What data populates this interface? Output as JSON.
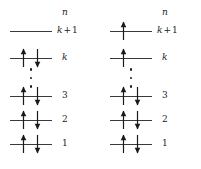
{
  "figure": {
    "background_color": "#ffffff",
    "line_color": "#3a3a3a",
    "arrow_color": "#1a1a1a",
    "text_color": "#1a1a1a"
  },
  "diagrams": [
    {
      "id": "left",
      "name": "ground-state-configuration",
      "header": "n",
      "levels": [
        {
          "id": "k-plus-1",
          "label_parts": {
            "base": "k",
            "op": "+",
            "num": "1"
          },
          "label_text": "k + 1",
          "y": 31,
          "line_x": 10,
          "line_width": 42,
          "label_x": 57,
          "spins": []
        },
        {
          "id": "k",
          "label_parts": {
            "base": "k",
            "op": "",
            "num": ""
          },
          "label_text": "k",
          "y": 58,
          "line_x": 10,
          "line_width": 42,
          "label_x": 62,
          "spins": [
            {
              "direction": "up",
              "x": 20
            },
            {
              "direction": "down",
              "x": 34
            }
          ]
        },
        {
          "id": "3",
          "label_parts": {
            "base": "",
            "op": "",
            "num": "3"
          },
          "label_text": "3",
          "y": 96,
          "line_x": 10,
          "line_width": 42,
          "label_x": 62,
          "spins": [
            {
              "direction": "up",
              "x": 20
            },
            {
              "direction": "down",
              "x": 34
            }
          ]
        },
        {
          "id": "2",
          "label_parts": {
            "base": "",
            "op": "",
            "num": "2"
          },
          "label_text": "2",
          "y": 120,
          "line_x": 10,
          "line_width": 42,
          "label_x": 62,
          "spins": [
            {
              "direction": "up",
              "x": 20
            },
            {
              "direction": "down",
              "x": 34
            }
          ]
        },
        {
          "id": "1",
          "label_parts": {
            "base": "",
            "op": "",
            "num": "1"
          },
          "label_text": "1",
          "y": 144,
          "line_x": 10,
          "line_width": 42,
          "label_x": 62,
          "spins": [
            {
              "direction": "up",
              "x": 20
            },
            {
              "direction": "down",
              "x": 34
            }
          ]
        }
      ],
      "ellipsis": {
        "x": 26,
        "y": 68,
        "height": 20,
        "dot_count": 3
      },
      "header_pos": {
        "x": 62,
        "y": 8
      }
    },
    {
      "id": "right",
      "name": "excited-state-configuration",
      "header": "n",
      "levels": [
        {
          "id": "k-plus-1",
          "label_parts": {
            "base": "k",
            "op": "+",
            "num": "1"
          },
          "label_text": "k + 1",
          "y": 31,
          "line_x": 10,
          "line_width": 42,
          "label_x": 57,
          "spins": [
            {
              "direction": "up",
              "x": 20
            }
          ]
        },
        {
          "id": "k",
          "label_parts": {
            "base": "k",
            "op": "",
            "num": ""
          },
          "label_text": "k",
          "y": 58,
          "line_x": 10,
          "line_width": 42,
          "label_x": 62,
          "spins": [
            {
              "direction": "up",
              "x": 20
            }
          ]
        },
        {
          "id": "3",
          "label_parts": {
            "base": "",
            "op": "",
            "num": "3"
          },
          "label_text": "3",
          "y": 96,
          "line_x": 10,
          "line_width": 42,
          "label_x": 62,
          "spins": [
            {
              "direction": "up",
              "x": 20
            },
            {
              "direction": "down",
              "x": 34
            }
          ]
        },
        {
          "id": "2",
          "label_parts": {
            "base": "",
            "op": "",
            "num": "2"
          },
          "label_text": "2",
          "y": 120,
          "line_x": 10,
          "line_width": 42,
          "label_x": 62,
          "spins": [
            {
              "direction": "up",
              "x": 20
            },
            {
              "direction": "down",
              "x": 34
            }
          ]
        },
        {
          "id": "1",
          "label_parts": {
            "base": "",
            "op": "",
            "num": "1"
          },
          "label_text": "1",
          "y": 144,
          "line_x": 10,
          "line_width": 42,
          "label_x": 62,
          "spins": [
            {
              "direction": "up",
              "x": 20
            },
            {
              "direction": "down",
              "x": 34
            }
          ]
        }
      ],
      "ellipsis": {
        "x": 26,
        "y": 68,
        "height": 20,
        "dot_count": 3
      },
      "header_pos": {
        "x": 62,
        "y": 8
      }
    }
  ]
}
